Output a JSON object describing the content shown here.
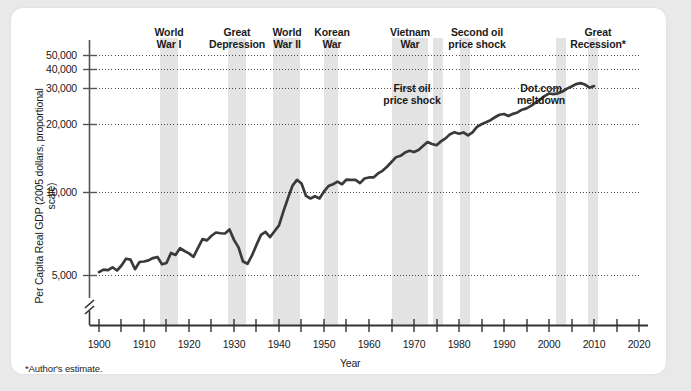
{
  "figure": {
    "footnote": "*Author's estimate.",
    "background_color": "#e9e9e9",
    "card_color": "#ffffff",
    "line_color": "#333333",
    "band_color": "#e0e0e0",
    "grid_color": "#555555"
  },
  "chart_data": {
    "type": "line",
    "title": "",
    "xlabel": "Year",
    "ylabel": "Per Capita Real GDP (2005 dollars, proportional scale)",
    "yscale": "log",
    "grid": true,
    "legend": "none",
    "xlim": [
      1900,
      2022
    ],
    "ylim": [
      4600,
      60000
    ],
    "xticks_major": [
      1900,
      1910,
      1920,
      1930,
      1940,
      1950,
      1960,
      1970,
      1980,
      1990,
      2000,
      2010,
      2020
    ],
    "xticks_minor": [
      1905,
      1915,
      1925,
      1935,
      1945,
      1955,
      1965,
      1975,
      1985,
      1995,
      2005,
      2015
    ],
    "yticks": [
      5000,
      10000,
      20000,
      30000,
      40000,
      50000
    ],
    "ytick_labels": [
      "5,000",
      "10,000",
      "20,000",
      "30,000",
      "40,000",
      "50,000"
    ],
    "axis_break": true,
    "x": [
      1900,
      1901,
      1902,
      1903,
      1904,
      1905,
      1906,
      1907,
      1908,
      1909,
      1910,
      1911,
      1912,
      1913,
      1914,
      1915,
      1916,
      1917,
      1918,
      1919,
      1920,
      1921,
      1922,
      1923,
      1924,
      1925,
      1926,
      1927,
      1928,
      1929,
      1930,
      1931,
      1932,
      1933,
      1934,
      1935,
      1936,
      1937,
      1938,
      1939,
      1940,
      1941,
      1942,
      1943,
      1944,
      1945,
      1946,
      1947,
      1948,
      1949,
      1950,
      1951,
      1952,
      1953,
      1954,
      1955,
      1956,
      1957,
      1958,
      1959,
      1960,
      1961,
      1962,
      1963,
      1964,
      1965,
      1966,
      1967,
      1968,
      1969,
      1970,
      1971,
      1972,
      1973,
      1974,
      1975,
      1976,
      1977,
      1978,
      1979,
      1980,
      1981,
      1982,
      1983,
      1984,
      1985,
      1986,
      1987,
      1988,
      1989,
      1990,
      1991,
      1992,
      1993,
      1994,
      1995,
      1996,
      1997,
      1998,
      1999,
      2000,
      2001,
      2002,
      2003,
      2004,
      2005,
      2006,
      2007,
      2008,
      2009,
      2010
    ],
    "y": [
      5180,
      5320,
      5290,
      5450,
      5270,
      5550,
      5960,
      5900,
      5340,
      5760,
      5790,
      5860,
      6000,
      6070,
      5620,
      5700,
      6330,
      6200,
      6650,
      6460,
      6300,
      6080,
      6670,
      7320,
      7220,
      7580,
      7840,
      7780,
      7760,
      8100,
      7260,
      6710,
      5790,
      5650,
      6170,
      6890,
      7650,
      7890,
      7470,
      7950,
      8450,
      9800,
      11250,
      12800,
      13600,
      13100,
      11500,
      11200,
      11450,
      11200,
      12050,
      12750,
      13000,
      13350,
      13000,
      13650,
      13600,
      13600,
      13150,
      13800,
      13950,
      13950,
      14550,
      14950,
      15600,
      16400,
      17250,
      17500,
      18100,
      18450,
      18200,
      18600,
      19400,
      20200,
      19800,
      19550,
      20350,
      21000,
      21950,
      22400,
      22050,
      22350,
      21650,
      22350,
      23700,
      24350,
      24850,
      25400,
      26200,
      26900,
      27100,
      26550,
      27150,
      27550,
      28350,
      28750,
      29500,
      30500,
      31500,
      32700,
      33600,
      33400,
      33650,
      34300,
      35350,
      36150,
      37050,
      37450,
      36900,
      35700,
      36300
    ],
    "event_bands": [
      {
        "label": "World\nWar I",
        "label_line1": "World",
        "label_line2": "War I",
        "start": 1914,
        "end": 1918
      },
      {
        "label": "Great\nDepression",
        "label_line1": "Great",
        "label_line2": "Depression",
        "start": 1929,
        "end": 1933
      },
      {
        "label": "World\nWar II",
        "label_line1": "World",
        "label_line2": "War II",
        "start": 1939,
        "end": 1945
      },
      {
        "label": "Korean\nWar",
        "label_line1": "Korean",
        "label_line2": "War",
        "start": 1950,
        "end": 1953
      },
      {
        "label": "Vietnam\nWar",
        "label_line1": "Vietnam",
        "label_line2": "War",
        "start": 1965,
        "end": 1973
      },
      {
        "label": "First oil\nprice shock",
        "label_line1": "First oil",
        "label_line2": "price shock",
        "start": 1973,
        "end": 1975
      },
      {
        "label": "Second oil\nprice shock",
        "label_line1": "Second oil",
        "label_line2": "price shock",
        "start": 1979,
        "end": 1981
      },
      {
        "label": "Dot.com\nmeltdown",
        "label_line1": "Dot.com",
        "label_line2": "meltdown",
        "start": 2000,
        "end": 2002
      },
      {
        "label": "Great\nRecession*",
        "label_line1": "Great",
        "label_line2": "Recession*",
        "start": 2007,
        "end": 2009
      }
    ],
    "annotations": [
      {
        "text_line1": "World",
        "text_line2": "War I",
        "position": "top"
      },
      {
        "text_line1": "Great",
        "text_line2": "Depression",
        "position": "top"
      },
      {
        "text_line1": "World",
        "text_line2": "War II",
        "position": "top"
      },
      {
        "text_line1": "Korean",
        "text_line2": "War",
        "position": "top"
      },
      {
        "text_line1": "Vietnam",
        "text_line2": "War",
        "position": "top"
      },
      {
        "text_line1": "Second oil",
        "text_line2": "price shock",
        "position": "top"
      },
      {
        "text_line1": "Great",
        "text_line2": "Recession*",
        "position": "top"
      },
      {
        "text_line1": "First oil",
        "text_line2": "price shock",
        "position": "inner"
      },
      {
        "text_line1": "Dot.com",
        "text_line2": "meltdown",
        "position": "inner"
      }
    ]
  },
  "ylabels": {
    "t50000": "50,000",
    "t40000": "40,000",
    "t30000": "30,000",
    "t20000": "20,000",
    "t10000": "10,000",
    "t5000": "5,000",
    "axis_title": "Per Capita Real GDP (2005 dollars, proportional scale)"
  },
  "xlabels": {
    "y1900": "1900",
    "y1910": "1910",
    "y1920": "1920",
    "y1930": "1930",
    "y1940": "1940",
    "y1950": "1950",
    "y1960": "1960",
    "y1970": "1970",
    "y1980": "1980",
    "y1990": "1990",
    "y2000": "2000",
    "y2010": "2010",
    "y2020": "2020",
    "axis_title": "Year"
  },
  "events": {
    "ww1_l1": "World",
    "ww1_l2": "War I",
    "gd_l1": "Great",
    "gd_l2": "Depression",
    "ww2_l1": "World",
    "ww2_l2": "War II",
    "korea_l1": "Korean",
    "korea_l2": "War",
    "vietnam_l1": "Vietnam",
    "vietnam_l2": "War",
    "oil2_l1": "Second oil",
    "oil2_l2": "price shock",
    "recession_l1": "Great",
    "recession_l2": "Recession*",
    "oil1_l1": "First oil",
    "oil1_l2": "price shock",
    "dotcom_l1": "Dot.com",
    "dotcom_l2": "meltdown"
  }
}
